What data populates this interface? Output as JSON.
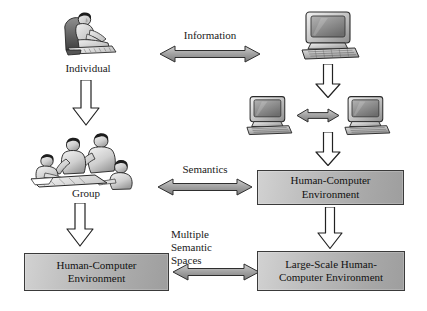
{
  "diagram": {
    "nodes": {
      "individual": {
        "label": "Individual",
        "icon": "person-reading-icon"
      },
      "group": {
        "label": "Group",
        "icon": "group-of-people-icon"
      },
      "computer_single": {
        "icon": "desktop-computer-icon"
      },
      "computer_left": {
        "icon": "desktop-computer-icon"
      },
      "computer_right": {
        "icon": "desktop-computer-icon"
      },
      "hce_right": {
        "line1": "Human-Computer",
        "line2": "Environment"
      },
      "hce_bottom_left": {
        "line1": "Human-Computer",
        "line2": "Environment"
      },
      "large_scale_hce": {
        "line1": "Large-Scale Human-",
        "line2": "Computer Environment"
      }
    },
    "edge_labels": {
      "information": "Information",
      "semantics": "Semantics",
      "multiple_semantic_spaces": {
        "line1": "Multiple",
        "line2": "Semantic",
        "line3": "Spaces"
      }
    },
    "arrows": {
      "information_arrow": "double-headed-horizontal-arrow",
      "semantics_arrow": "double-headed-horizontal-arrow",
      "spaces_arrow": "double-headed-horizontal-arrow",
      "computers_arrow": "double-headed-horizontal-arrow",
      "individual_to_group": "down-arrow",
      "group_to_hce": "down-arrow",
      "computer_to_computers": "down-arrow",
      "computers_to_hce": "down-arrow",
      "hce_to_large_scale": "down-arrow"
    },
    "colors": {
      "box_fill_light": "#d2d2d2",
      "box_fill_dark": "#9e9e9e",
      "box_border": "#3a3a3a",
      "arrow_fill_gray": "#a8a8a8",
      "arrow_stroke": "#2e2e2e",
      "arrow_fill_white": "#ffffff",
      "text": "#1a1a1a",
      "background": "#ffffff"
    }
  }
}
